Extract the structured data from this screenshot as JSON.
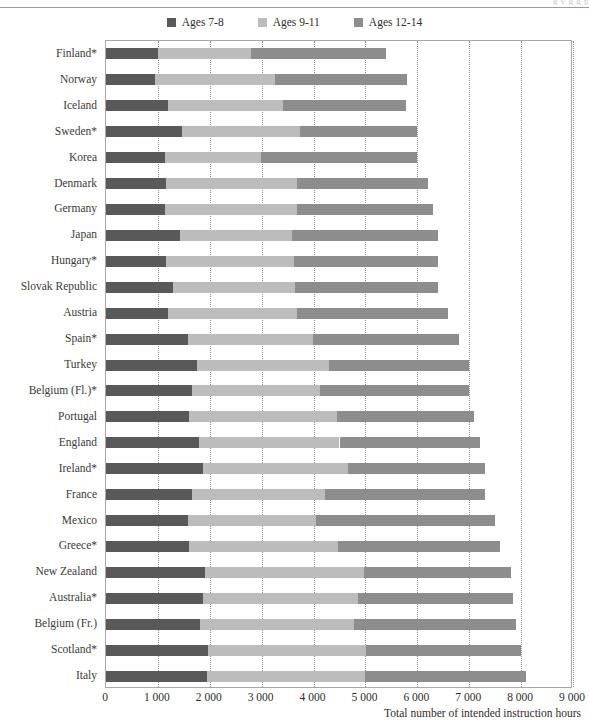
{
  "header": {
    "cropped_fragment": "g y g g p"
  },
  "legend": {
    "position": "top-center",
    "items": [
      {
        "label": "Ages 7-8",
        "color": "#595959",
        "icon": "square-swatch-icon"
      },
      {
        "label": "Ages 9-11",
        "color": "#bcbcbc",
        "icon": "square-swatch-icon"
      },
      {
        "label": "Ages 12-14",
        "color": "#8d8d8d",
        "icon": "square-swatch-icon"
      }
    ]
  },
  "axis": {
    "x_title": "Total number of intended instruction hours",
    "x_ticks": [
      "0",
      "1 000",
      "2 000",
      "3 000",
      "4 000",
      "5 000",
      "6 000",
      "7 000",
      "8 000",
      "9 000"
    ]
  },
  "chart_data": {
    "type": "bar",
    "orientation": "horizontal",
    "stacked": true,
    "title": "",
    "subtitle": "",
    "xlabel": "Total number of intended instruction hours",
    "ylabel": "",
    "xlim": [
      0,
      9000
    ],
    "xticks": [
      0,
      1000,
      2000,
      3000,
      4000,
      5000,
      6000,
      7000,
      8000,
      9000
    ],
    "grid": "vertical-dotted",
    "legend_position": "top-center",
    "categories": [
      "Finland*",
      "Norway",
      "Iceland",
      "Sweden*",
      "Korea",
      "Denmark",
      "Germany",
      "Japan",
      "Hungary*",
      "Slovak Republic",
      "Austria",
      "Spain*",
      "Turkey",
      "Belgium (Fl.)*",
      "Portugal",
      "England",
      "Ireland*",
      "France",
      "Mexico",
      "Greece*",
      "New Zealand",
      "Australia*",
      "Belgium (Fr.)",
      "Scotland*",
      "Italy"
    ],
    "series": [
      {
        "name": "Ages 7-8",
        "color": "#595959",
        "values": [
          1000,
          940,
          1200,
          1460,
          1130,
          1160,
          1130,
          1420,
          1150,
          1300,
          1200,
          1580,
          1760,
          1660,
          1600,
          1800,
          1860,
          1660,
          1580,
          1600,
          1900,
          1860,
          1820,
          1960,
          1950
        ]
      },
      {
        "name": "Ages 9-11",
        "color": "#bcbcbc",
        "values": [
          1800,
          2320,
          2220,
          2280,
          1850,
          2520,
          2560,
          2170,
          2470,
          2340,
          2480,
          2400,
          2540,
          2460,
          2860,
          2700,
          2800,
          2560,
          2470,
          2870,
          3080,
          3000,
          2960,
          3060,
          3050
        ]
      },
      {
        "name": "Ages 12-14",
        "color": "#8d8d8d",
        "values": [
          2600,
          2540,
          2360,
          2260,
          3020,
          2520,
          2610,
          2810,
          2780,
          2760,
          2920,
          2820,
          2700,
          2880,
          2640,
          2700,
          2640,
          3080,
          3450,
          3130,
          2820,
          2990,
          3120,
          2980,
          3100
        ]
      }
    ],
    "totals": [
      5400,
      5800,
      5780,
      6000,
      6000,
      6200,
      6300,
      6400,
      6400,
      6400,
      6600,
      6800,
      7000,
      7000,
      7100,
      7200,
      7300,
      7300,
      7500,
      7600,
      7800,
      7850,
      7900,
      8000,
      8100
    ],
    "note": "Values are estimated from stacked-segment boundaries against the 1 000-hour gridlines."
  }
}
